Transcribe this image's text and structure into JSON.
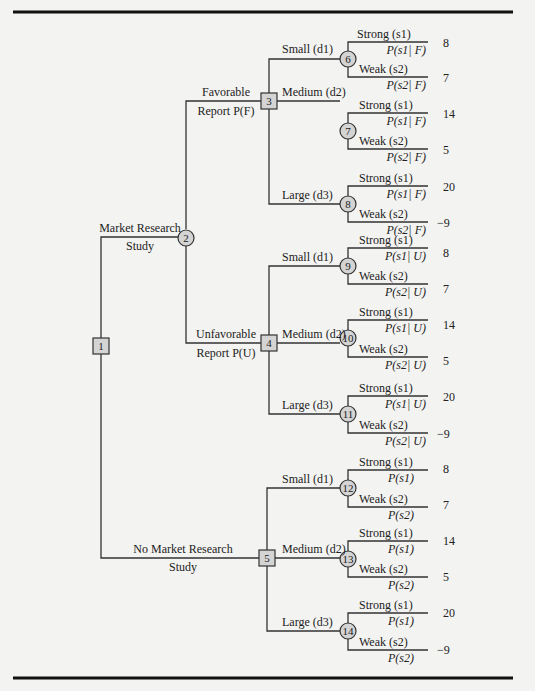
{
  "figure": {
    "colors": {
      "background": "#f3f3f1",
      "node_fill": "#d4d4d4",
      "line": "#333333",
      "rule": "#111111"
    }
  },
  "nodes": {
    "n1": {
      "id": "1",
      "type": "decision"
    },
    "n2": {
      "id": "2",
      "type": "chance"
    },
    "n3": {
      "id": "3",
      "type": "decision"
    },
    "n4": {
      "id": "4",
      "type": "decision"
    },
    "n5": {
      "id": "5",
      "type": "decision"
    },
    "n6": {
      "id": "6",
      "type": "chance"
    },
    "n7": {
      "id": "7",
      "type": "chance"
    },
    "n8": {
      "id": "8",
      "type": "chance"
    },
    "n9": {
      "id": "9",
      "type": "chance"
    },
    "n10": {
      "id": "10",
      "type": "chance"
    },
    "n11": {
      "id": "11",
      "type": "chance"
    },
    "n12": {
      "id": "12",
      "type": "chance"
    },
    "n13": {
      "id": "13",
      "type": "chance"
    },
    "n14": {
      "id": "14",
      "type": "chance"
    }
  },
  "branches": {
    "market_research": {
      "line1": "Market Research",
      "line2": "Study"
    },
    "no_market_research": {
      "line1": "No Market Research",
      "line2": "Study"
    },
    "favorable": {
      "line1": "Favorable",
      "line2": "Report P(F)"
    },
    "unfavorable": {
      "line1": "Unfavorable",
      "line2": "Report P(U)"
    },
    "small": "Small (d1)",
    "medium": "Medium (d2)",
    "large": "Large (d3)",
    "strong": "Strong (s1)",
    "weak": "Weak (s2)"
  },
  "probabilities": {
    "s1_given_F": "P(s1| F)",
    "s2_given_F": "P(s2| F)",
    "s1_given_U": "P(s1| U)",
    "s2_given_U": "P(s2| U)",
    "s1": "P(s1)",
    "s2": "P(s2)"
  },
  "payoffs": {
    "small_strong": "8",
    "small_weak": "7",
    "medium_strong": "14",
    "medium_weak": "5",
    "large_strong": "20",
    "large_weak": "−9"
  }
}
